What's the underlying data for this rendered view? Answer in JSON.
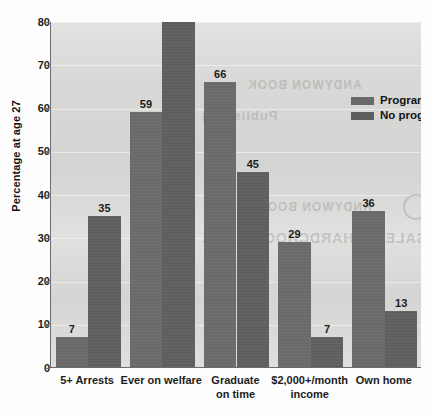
{
  "chart_data": {
    "type": "bar",
    "title": "",
    "xlabel": "",
    "ylabel": "Percentage at age 27",
    "ylim": [
      0,
      80
    ],
    "yticks": [
      0,
      10,
      20,
      30,
      40,
      50,
      60,
      70,
      80
    ],
    "grid": true,
    "legend_position": "top-right",
    "categories": [
      "5+ Arrests",
      "Ever on welfare",
      "Graduate\non time",
      "$2,000+/month\nincome",
      "Own home"
    ],
    "category_lines": [
      [
        "5+ Arrests"
      ],
      [
        "Ever on welfare"
      ],
      [
        "Graduate",
        "on time"
      ],
      [
        "$2,000+/month",
        "income"
      ],
      [
        "Own home"
      ]
    ],
    "series": [
      {
        "name": "Programme",
        "color": "#6a6a6a",
        "values": [
          7,
          59,
          66,
          29,
          36
        ]
      },
      {
        "name": "No programme",
        "color": "#5e5e5e",
        "values": [
          35,
          80,
          45,
          7,
          13
        ]
      }
    ]
  },
  "bleed_through": {
    "line1": "ANDYWON BOOK",
    "line2": "SALES & HARDCHOOD BOOK",
    "line3": "ANDYWON BOOK",
    "line4": "Publishing"
  },
  "colors": {
    "plot_background": "#d8d8d6",
    "axis": "#6b6b6b",
    "text": "#1c1c1c",
    "series_a": "#6a6a6a",
    "series_b": "#5e5e5e"
  }
}
